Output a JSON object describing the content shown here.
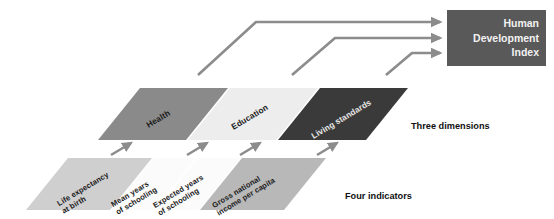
{
  "diagram": {
    "title_box": {
      "name": "human-development-index",
      "lines": [
        "Human",
        "Development",
        "Index"
      ],
      "fill": "#595959",
      "text_color": "#f2f2f2"
    },
    "captions": {
      "dimensions": "Three dimensions",
      "indicators": "Four indicators"
    },
    "dimensions": [
      {
        "label": "Health",
        "fill": "#8a8a8a"
      },
      {
        "label": "Education",
        "fill": "#ededed"
      },
      {
        "label": "Living standards",
        "fill": "#3a3a3a"
      }
    ],
    "indicators": [
      {
        "label": "Life expectancy\nat birth",
        "fill": "#cfcfcf"
      },
      {
        "label": "Mean years\nof schooling",
        "fill": "#fbfbfb"
      },
      {
        "label": "Expected years\nof schooling",
        "fill": "#fbfbfb"
      },
      {
        "label": "Gross national\nincome per capita",
        "fill": "#b8b8b8"
      }
    ],
    "arrow_color": "#8c8c8c",
    "flows": [
      {
        "from": "Health",
        "to": "Human Development Index"
      },
      {
        "from": "Education",
        "to": "Human Development Index"
      },
      {
        "from": "Living standards",
        "to": "Human Development Index"
      }
    ],
    "links": [
      {
        "from": "Life expectancy at birth",
        "to": "Health"
      },
      {
        "from": "Mean years of schooling",
        "to": "Education"
      },
      {
        "from": "Expected years of schooling",
        "to": "Education"
      },
      {
        "from": "Gross national income per capita",
        "to": "Living standards"
      }
    ]
  }
}
